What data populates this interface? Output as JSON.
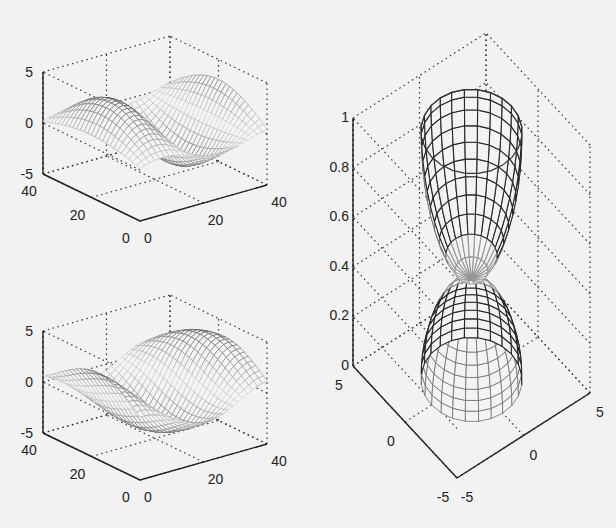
{
  "figure": {
    "background": "#f2f2f2",
    "axis_color": "#222222",
    "grid_color": "#333333"
  },
  "chart_data": [
    {
      "id": "top-left",
      "type": "surface",
      "title": "",
      "surface": "wireframe mesh, 3D sinusoidal ripple surface (two peaks / two valleys)",
      "xlim": [
        0,
        40
      ],
      "ylim": [
        0,
        40
      ],
      "zlim": [
        -5,
        5
      ],
      "x_ticks": [
        "0",
        "20",
        "40"
      ],
      "y_ticks": [
        "0",
        "20",
        "40"
      ],
      "z_ticks": [
        "-5",
        "0",
        "5"
      ],
      "grid": true
    },
    {
      "id": "bottom-left",
      "type": "surface",
      "title": "",
      "surface": "wireframe mesh, 3D sinusoidal ripple surface (phase-shifted)",
      "xlim": [
        0,
        40
      ],
      "ylim": [
        0,
        40
      ],
      "zlim": [
        -5,
        5
      ],
      "x_ticks": [
        "0",
        "20",
        "40"
      ],
      "y_ticks": [
        "0",
        "20",
        "40"
      ],
      "z_ticks": [
        "-5",
        "0",
        "5"
      ],
      "grid": true
    },
    {
      "id": "right",
      "type": "surface",
      "title": "",
      "surface": "wireframe mesh, hourglass / double-cone surface meeting at z=0.4",
      "xlim": [
        -5,
        5
      ],
      "ylim": [
        -5,
        5
      ],
      "zlim": [
        0,
        1
      ],
      "x_ticks": [
        "-5",
        "0",
        "5"
      ],
      "y_ticks": [
        "-5",
        "0",
        "5"
      ],
      "z_ticks": [
        "0",
        "0.2",
        "0.4",
        "0.6",
        "0.8",
        "1"
      ],
      "grid": true
    }
  ]
}
